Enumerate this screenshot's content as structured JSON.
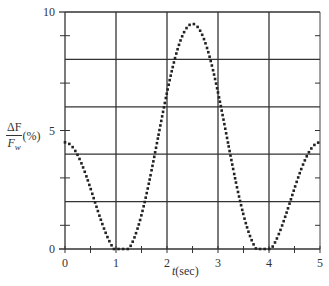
{
  "chart_data": {
    "type": "scatter",
    "title": "",
    "xlabel": "t(sec)",
    "ylabel": "ΔF/Fw (%)",
    "ylabel_parts": {
      "num": "ΔF",
      "den": "F",
      "den_sub": "w",
      "unit": "(%)"
    },
    "xlim": [
      0,
      5
    ],
    "ylim": [
      0,
      10
    ],
    "x_ticks": [
      "0",
      "1",
      "2",
      "3",
      "4",
      "5"
    ],
    "y_tick_labels": [
      "0",
      "5",
      "10"
    ],
    "y_gridlines": [
      2,
      4,
      6,
      8,
      10
    ],
    "x_gridlines": [
      1,
      2,
      3,
      4
    ],
    "grid": true,
    "legend": null,
    "marker": "dotted curve",
    "key_points": [
      {
        "t": 0,
        "value": 4.5
      },
      {
        "t": 1.25,
        "value": 0
      },
      {
        "t": 2.5,
        "value": 9.5
      },
      {
        "t": 3.75,
        "value": 0
      },
      {
        "t": 5,
        "value": 4.5
      }
    ],
    "x": [
      0,
      0.25,
      0.5,
      0.75,
      1,
      1.25,
      1.5,
      1.75,
      2,
      2.25,
      2.5,
      2.75,
      3,
      3.25,
      3.5,
      3.75,
      4,
      4.25,
      4.5,
      4.75,
      5
    ],
    "values": [
      4.5,
      4.11,
      3.07,
      1.72,
      0.56,
      0.0,
      0.23,
      1.14,
      2.94,
      5.84,
      9.5,
      5.84,
      2.94,
      1.14,
      0.23,
      0.0,
      0.56,
      1.72,
      3.07,
      4.11,
      4.5
    ]
  }
}
